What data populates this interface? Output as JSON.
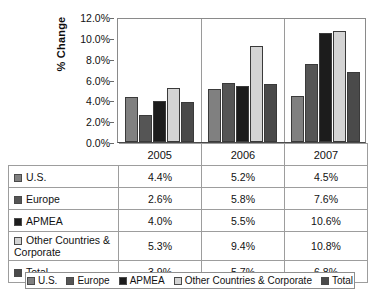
{
  "chart_data": {
    "type": "bar",
    "title": "",
    "xlabel": "",
    "ylabel": "% Change",
    "categories": [
      "2005",
      "2006",
      "2007"
    ],
    "ylim": [
      0,
      12
    ],
    "ytick_labels": [
      "0.0%",
      "2.0%",
      "4.0%",
      "6.0%",
      "8.0%",
      "10.0%",
      "12.0%"
    ],
    "ytick_values": [
      0,
      2,
      4,
      6,
      8,
      10,
      12
    ],
    "grid": false,
    "legend_position": "bottom",
    "series": [
      {
        "name": "U.S.",
        "color": "#808080",
        "values": [
          4.4,
          5.2,
          4.5
        ],
        "labels": [
          "4.4%",
          "5.2%",
          "4.5%"
        ]
      },
      {
        "name": "Europe",
        "color": "#555555",
        "values": [
          2.6,
          5.8,
          7.6
        ],
        "labels": [
          "2.6%",
          "5.8%",
          "7.6%"
        ]
      },
      {
        "name": "APMEA",
        "color": "#1c1c1c",
        "values": [
          4.0,
          5.5,
          10.6
        ],
        "labels": [
          "4.0%",
          "5.5%",
          "10.6%"
        ]
      },
      {
        "name": "Other Countries & Corporate",
        "color": "#d4d4d4",
        "values": [
          5.3,
          9.4,
          10.8
        ],
        "labels": [
          "5.3%",
          "9.4%",
          "10.8%"
        ]
      },
      {
        "name": "Total",
        "color": "#4a4a4a",
        "values": [
          3.9,
          5.7,
          6.8
        ],
        "labels": [
          "3.9%",
          "5.7%",
          "6.8%"
        ]
      }
    ]
  },
  "table": {
    "year_headers": [
      "2005",
      "2006",
      "2007"
    ],
    "rows": [
      {
        "label": "U.S.",
        "values": [
          "4.4%",
          "5.2%",
          "4.5%"
        ]
      },
      {
        "label": "Europe",
        "values": [
          "2.6%",
          "5.8%",
          "7.6%"
        ]
      },
      {
        "label": "APMEA",
        "values": [
          "4.0%",
          "5.5%",
          "10.6%"
        ]
      },
      {
        "label": "Other Countries & Corporate",
        "values": [
          "5.3%",
          "9.4%",
          "10.8%"
        ]
      },
      {
        "label": "Total",
        "values": [
          "3.9%",
          "5.7%",
          "6.8%"
        ]
      }
    ]
  },
  "legend": {
    "items": [
      "U.S.",
      "Europe",
      "APMEA",
      "Other Countries & Corporate",
      "Total"
    ]
  }
}
